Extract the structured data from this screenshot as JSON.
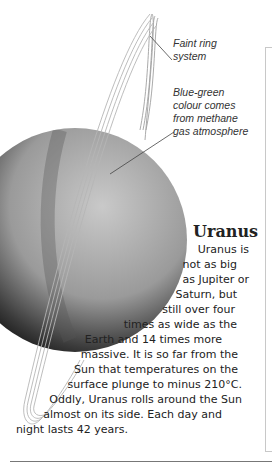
{
  "captions": {
    "ring": [
      "Faint ring",
      "system"
    ],
    "colour": [
      "Blue-green",
      "colour comes",
      "from methane",
      "gas atmosphere"
    ]
  },
  "article": {
    "title": "Uranus",
    "lines": [
      "Uranus is",
      "not as big",
      "as Jupiter or",
      "Saturn, but",
      "still over four",
      "times as wide as the",
      "Earth and 14 times more",
      "massive. It is so far from the",
      "Sun that temperatures on the",
      "surface plunge to minus 210°C.",
      "Oddly, Uranus rolls around the Sun",
      "almost on its side. Each day and",
      "night lasts 42 years."
    ]
  },
  "colors": {
    "planet_light": "#bdbdbd",
    "planet_dark": "#2a2a2a",
    "ring": "#9a9a9a",
    "frame": "#c8c8c8"
  }
}
